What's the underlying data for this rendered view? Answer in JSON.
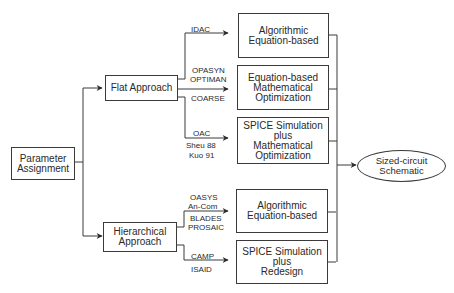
{
  "diagram": {
    "root": {
      "lines": [
        "Parameter",
        "Assignment"
      ]
    },
    "approaches": [
      {
        "id": "flat",
        "lines": [
          "Flat Approach"
        ]
      },
      {
        "id": "hierarchical",
        "lines": [
          "Hierarchical",
          "Approach"
        ]
      }
    ],
    "methods": [
      {
        "lines": [
          "Algorithmic",
          "Equation-based"
        ],
        "tools": [
          "IDAC"
        ]
      },
      {
        "lines": [
          "Equation-based",
          "Mathematical",
          "Optimization"
        ],
        "tools_above": [
          "OPASYN",
          "OPTIMAN"
        ],
        "tools_below": [
          "COARSE"
        ]
      },
      {
        "lines": [
          "SPICE Simulation",
          "plus",
          "Mathematical",
          "Optimization"
        ],
        "tools_above": [
          "OAC"
        ],
        "tools_below": [
          "Sheu 88",
          "Kuo 91"
        ]
      },
      {
        "lines": [
          "Algorithmic",
          "Equation-based"
        ],
        "tools_above": [
          "OASYS",
          "An-Com"
        ],
        "tools_below": [
          "BLADES",
          "PROSAIC"
        ]
      },
      {
        "lines": [
          "SPICE Simulation",
          "plus",
          "Redesign"
        ],
        "tools_above": [
          "CAMP"
        ],
        "tools_below": [
          "ISAID"
        ]
      }
    ],
    "output": {
      "lines": [
        "Sized-circuit",
        "Schematic"
      ]
    }
  }
}
